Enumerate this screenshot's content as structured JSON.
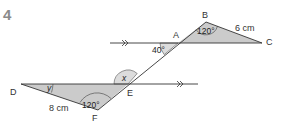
{
  "question_number": "4",
  "points": {
    "A": "A",
    "B": "B",
    "C": "C",
    "D": "D",
    "E": "E",
    "F": "F"
  },
  "angles": {
    "at_A": "40°",
    "at_B": "120°",
    "at_F": "120°",
    "at_E": "x",
    "at_D": "y"
  },
  "lengths": {
    "BC": "6 cm",
    "DF": "8 cm"
  },
  "colors": {
    "fill": "#c9c9c9",
    "line": "#333333",
    "text": "#333333",
    "number": "#8a8a8a"
  }
}
